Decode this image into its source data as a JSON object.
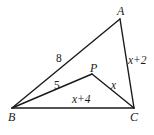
{
  "figure": {
    "vertices": [
      {
        "id": "A",
        "label": "A",
        "x": 120,
        "y": 19
      },
      {
        "id": "B",
        "label": "B",
        "x": 12,
        "y": 108
      },
      {
        "id": "C",
        "label": "C",
        "x": 134,
        "y": 108
      },
      {
        "id": "P",
        "label": "P",
        "x": 92,
        "y": 74
      }
    ],
    "edges": [
      {
        "from": "A",
        "to": "B",
        "label": "8"
      },
      {
        "from": "A",
        "to": "C",
        "label": "x+2"
      },
      {
        "from": "B",
        "to": "C",
        "label": "x+4"
      },
      {
        "from": "B",
        "to": "P",
        "label": "5"
      },
      {
        "from": "P",
        "to": "C",
        "label": "x"
      }
    ]
  },
  "labels": {
    "A": "A",
    "B": "B",
    "C": "C",
    "P": "P",
    "AB": "8",
    "AC": "x+2",
    "BC": "x+4",
    "BP": "5",
    "PC": "x"
  }
}
